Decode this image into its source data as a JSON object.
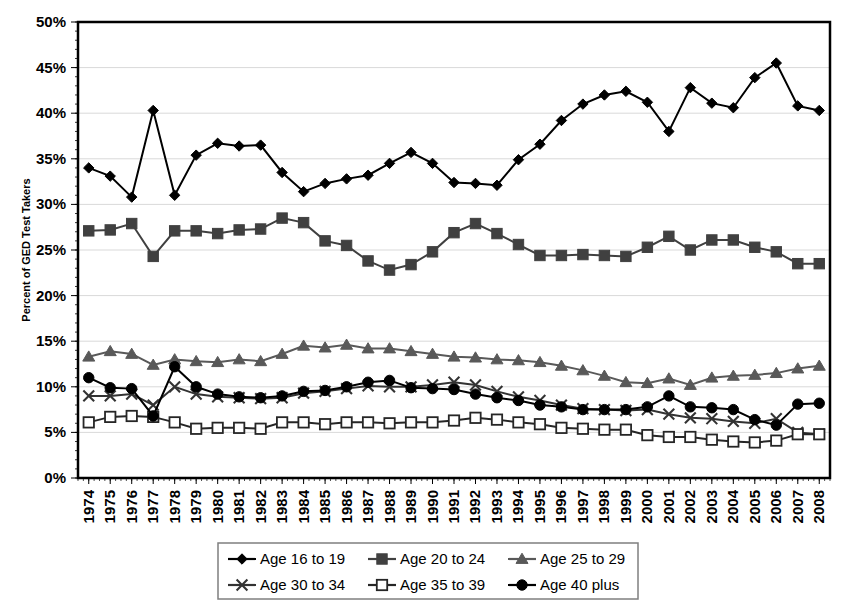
{
  "chart_data": {
    "type": "line",
    "title": "",
    "xlabel": "",
    "ylabel": "Percent of GED Test Takers",
    "ylim": [
      0,
      50
    ],
    "ytick_labels": [
      "0%",
      "5%",
      "10%",
      "15%",
      "20%",
      "25%",
      "30%",
      "35%",
      "40%",
      "45%",
      "50%"
    ],
    "ytick_values": [
      0,
      5,
      10,
      15,
      20,
      25,
      30,
      35,
      40,
      45,
      50
    ],
    "grid": true,
    "legend_position": "bottom",
    "categories": [
      "1974",
      "1975",
      "1976",
      "1977",
      "1978",
      "1979",
      "1980",
      "1981",
      "1982",
      "1983",
      "1984",
      "1985",
      "1986",
      "1987",
      "1988",
      "1989",
      "1990",
      "1991",
      "1992",
      "1993",
      "1994",
      "1995",
      "1996",
      "1997",
      "1998",
      "1999",
      "2000",
      "2001",
      "2002",
      "2003",
      "2004",
      "2005",
      "2006",
      "2007",
      "2008"
    ],
    "series": [
      {
        "name": "Age 16 to 19",
        "marker": "diamond",
        "color": "#000000",
        "values": [
          34.0,
          33.1,
          30.8,
          40.3,
          31.0,
          35.4,
          36.7,
          36.4,
          36.5,
          33.5,
          31.4,
          32.3,
          32.8,
          33.2,
          34.5,
          35.7,
          34.5,
          32.4,
          32.3,
          32.1,
          34.9,
          36.6,
          39.2,
          41.0,
          42.0,
          42.4,
          41.2,
          38.0,
          42.8,
          41.1,
          40.6,
          43.9,
          45.5,
          40.8,
          40.3
        ]
      },
      {
        "name": "Age 20 to 24",
        "marker": "square",
        "color": "#404040",
        "values": [
          27.1,
          27.2,
          27.9,
          24.3,
          27.1,
          27.1,
          26.8,
          27.2,
          27.3,
          28.5,
          28.0,
          26.0,
          25.5,
          23.8,
          22.8,
          23.4,
          24.8,
          26.9,
          27.9,
          26.8,
          25.6,
          24.4,
          24.4,
          24.5,
          24.4,
          24.3,
          25.3,
          26.5,
          25.0,
          26.1,
          26.1,
          25.3,
          24.8,
          23.5,
          23.5
        ]
      },
      {
        "name": "Age 25 to 29",
        "marker": "triangle",
        "color": "#595959",
        "values": [
          13.3,
          13.9,
          13.6,
          12.4,
          13.0,
          12.8,
          12.7,
          13.0,
          12.8,
          13.6,
          14.5,
          14.3,
          14.6,
          14.2,
          14.2,
          13.9,
          13.6,
          13.3,
          13.2,
          13.0,
          12.9,
          12.7,
          12.3,
          11.8,
          11.2,
          10.5,
          10.4,
          10.9,
          10.2,
          11.0,
          11.2,
          11.3,
          11.5,
          12.0,
          12.3
        ]
      },
      {
        "name": "Age 30 to 34",
        "marker": "cross",
        "color": "#333333",
        "values": [
          9.0,
          9.0,
          9.2,
          8.0,
          10.0,
          9.2,
          8.9,
          8.8,
          8.7,
          8.8,
          9.3,
          9.5,
          9.8,
          10.1,
          10.0,
          10.0,
          10.2,
          10.5,
          10.2,
          9.5,
          8.9,
          8.5,
          8.0,
          7.6,
          7.5,
          7.4,
          7.5,
          7.0,
          6.6,
          6.5,
          6.2,
          6.0,
          6.5,
          5.0,
          4.8
        ]
      },
      {
        "name": "Age 35 to 39",
        "marker": "open-square",
        "color": "#262626",
        "values": [
          6.1,
          6.7,
          6.8,
          6.7,
          6.1,
          5.4,
          5.5,
          5.5,
          5.4,
          6.1,
          6.1,
          5.9,
          6.1,
          6.1,
          6.0,
          6.1,
          6.1,
          6.3,
          6.6,
          6.4,
          6.1,
          5.9,
          5.5,
          5.4,
          5.3,
          5.3,
          4.7,
          4.5,
          4.5,
          4.2,
          4.0,
          3.9,
          4.1,
          4.8,
          4.8
        ]
      },
      {
        "name": "Age 40 plus",
        "marker": "circle",
        "color": "#000000",
        "values": [
          11.0,
          9.9,
          9.8,
          6.8,
          12.2,
          10.0,
          9.2,
          8.9,
          8.8,
          9.0,
          9.5,
          9.6,
          10.0,
          10.5,
          10.7,
          9.9,
          9.8,
          9.7,
          9.2,
          8.8,
          8.5,
          8.0,
          7.8,
          7.5,
          7.5,
          7.5,
          7.8,
          9.0,
          7.8,
          7.7,
          7.5,
          6.4,
          5.8,
          8.1,
          8.2
        ]
      }
    ]
  },
  "legend": {
    "items": [
      {
        "label": "Age 16 to 19",
        "marker": "diamond"
      },
      {
        "label": "Age 20 to 24",
        "marker": "square"
      },
      {
        "label": "Age 25 to 29",
        "marker": "triangle"
      },
      {
        "label": "Age 30 to 34",
        "marker": "cross"
      },
      {
        "label": "Age 35 to 39",
        "marker": "open-square"
      },
      {
        "label": "Age 40 plus",
        "marker": "circle"
      }
    ]
  },
  "colors": {
    "axis": "#000000",
    "grid": "#d9d9d9",
    "background": "#ffffff"
  }
}
